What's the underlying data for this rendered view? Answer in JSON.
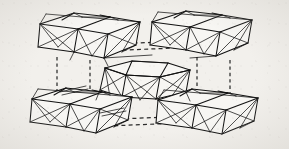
{
  "figure": {
    "kind": "line-drawing",
    "caption": "",
    "width": 289,
    "height": 149,
    "background_color": "#f2f0ec",
    "line_color": "#111111",
    "dashed_line_color": "#2b2b2b",
    "face_fill_color": "#f7f6f3"
  },
  "legend": {
    "visible": false,
    "entries": []
  },
  "labels": {
    "visible": false,
    "items": []
  },
  "chart_data": {
    "type": "diagram",
    "title": "",
    "xlabel": "",
    "ylabel": "",
    "clusters": [
      {
        "id": "cluster-top-left",
        "position": "top-left",
        "block_count": 3,
        "description": "triangulated polyhedral cluster of edge-sharing blocks"
      },
      {
        "id": "cluster-top-right",
        "position": "top-right",
        "block_count": 3,
        "description": "triangulated polyhedral cluster of edge-sharing blocks"
      },
      {
        "id": "cluster-center",
        "position": "body-center",
        "block_count": 2,
        "description": "flattened triangulated polyhedron at the body centre of the cell"
      },
      {
        "id": "cluster-bottom-left",
        "position": "bottom-left",
        "block_count": 3,
        "description": "triangulated polyhedral cluster of edge-sharing blocks"
      },
      {
        "id": "cluster-bottom-right",
        "position": "bottom-right",
        "block_count": 3,
        "description": "triangulated polyhedral cluster of edge-sharing blocks"
      }
    ],
    "unit_cell_edges": [
      {
        "id": "cell-edge-top-a",
        "style": "dashed",
        "orientation": "horizontal"
      },
      {
        "id": "cell-edge-top-b",
        "style": "dashed",
        "orientation": "horizontal"
      },
      {
        "id": "cell-edge-bottom-a",
        "style": "dashed",
        "orientation": "horizontal"
      },
      {
        "id": "cell-edge-bottom-b",
        "style": "dashed",
        "orientation": "horizontal"
      },
      {
        "id": "cell-edge-left-a",
        "style": "dashed",
        "orientation": "vertical"
      },
      {
        "id": "cell-edge-left-b",
        "style": "dashed",
        "orientation": "vertical"
      },
      {
        "id": "cell-edge-right-a",
        "style": "dashed",
        "orientation": "vertical"
      },
      {
        "id": "cell-edge-right-b",
        "style": "dashed",
        "orientation": "vertical"
      },
      {
        "id": "cell-edge-mid-left",
        "style": "solid",
        "orientation": "horizontal"
      },
      {
        "id": "cell-edge-mid-right",
        "style": "solid",
        "orientation": "horizontal"
      }
    ],
    "geometry": {
      "clusters": [
        {
          "id": "cluster-top-left",
          "fills": [
            "M 40 24 L 74 13 L 110 17 L 78 29 Z",
            "M 78 29 L 110 17 L 140 22 L 108 34 Z",
            "M 40 24 L 78 29 L 74 52 L 38 47 Z",
            "M 78 29 L 108 34 L 104 58 L 74 52 Z",
            "M 108 34 L 140 22 L 136 45 L 104 58 Z"
          ],
          "solid": [
            "M 40 24 L 74 13 L 110 17 L 140 22 L 136 45 L 104 58 L 74 52 L 38 47 Z",
            "M 40 24 L 78 29 L 110 17",
            "M 78 29 L 108 34 L 140 22",
            "M 78 29 L 74 52",
            "M 108 34 L 104 58",
            "M 62 20 L 74 13",
            "M 100 15 L 110 17"
          ],
          "thin": [
            "M 40 24 L 58 47",
            "M 40 24 L 74 52",
            "M 78 29 L 58 47",
            "M 78 29 L 38 47",
            "M 78 29 L 92 56",
            "M 108 34 L 92 56",
            "M 108 34 L 74 52",
            "M 140 22 L 122 52",
            "M 140 22 L 104 58",
            "M 108 34 L 136 45",
            "M 122 52 L 136 45",
            "M 46 14 L 40 24",
            "M 74 13 L 82 17",
            "M 82 17 L 110 17",
            "M 110 17 L 118 20",
            "M 118 20 L 140 22",
            "M 46 14 L 82 17",
            "M 82 17 L 118 20"
          ]
        },
        {
          "id": "cluster-top-right",
          "fills": [
            "M 152 22 L 186 11 L 222 15 L 190 27 Z",
            "M 190 27 L 222 15 L 252 20 L 220 32 Z",
            "M 152 22 L 190 27 L 186 50 L 150 45 Z",
            "M 190 27 L 220 32 L 216 56 L 186 50 Z",
            "M 220 32 L 252 20 L 248 43 L 216 56 Z"
          ],
          "solid": [
            "M 152 22 L 186 11 L 222 15 L 252 20 L 248 43 L 216 56 L 186 50 L 150 45 Z",
            "M 152 22 L 190 27 L 222 15",
            "M 190 27 L 220 32 L 252 20",
            "M 190 27 L 186 50",
            "M 220 32 L 216 56",
            "M 174 18 L 186 11",
            "M 212 13 L 222 15"
          ],
          "thin": [
            "M 152 22 L 170 45",
            "M 152 22 L 186 50",
            "M 190 27 L 170 45",
            "M 190 27 L 150 45",
            "M 190 27 L 204 54",
            "M 220 32 L 204 54",
            "M 220 32 L 186 50",
            "M 252 20 L 234 50",
            "M 252 20 L 216 56",
            "M 220 32 L 248 43",
            "M 234 50 L 248 43",
            "M 158 12 L 152 22",
            "M 186 11 L 194 15",
            "M 194 15 L 222 15",
            "M 222 15 L 230 18",
            "M 230 18 L 252 20",
            "M 158 12 L 194 15",
            "M 194 15 L 230 18"
          ]
        },
        {
          "id": "cluster-center",
          "fills": [
            "M 105 68 L 132 61 L 168 63 L 190 70 L 160 77 L 126 75 Z",
            "M 105 68 L 126 75 L 122 97 L 100 90 Z",
            "M 126 75 L 160 77 L 156 99 L 122 97 Z",
            "M 160 77 L 190 70 L 186 92 L 156 99 Z"
          ],
          "solid": [
            "M 105 68 L 132 61 L 168 63 L 190 70 L 186 92 L 156 99 L 122 97 L 100 90 Z",
            "M 105 68 L 126 75 L 132 61",
            "M 126 75 L 160 77 L 168 63",
            "M 160 77 L 190 70",
            "M 126 75 L 122 97",
            "M 160 77 L 156 99",
            "M 105 68 L 126 75 L 160 77 L 190 70"
          ],
          "thin": [
            "M 105 68 L 122 97",
            "M 105 68 L 110 97",
            "M 126 75 L 100 90",
            "M 126 75 L 140 100",
            "M 126 75 L 156 99",
            "M 160 77 L 122 97",
            "M 160 77 L 140 100",
            "M 160 77 L 186 92",
            "M 190 70 L 156 99",
            "M 190 70 L 172 96",
            "M 132 61 L 168 63"
          ]
        },
        {
          "id": "cluster-bottom-left",
          "fills": [
            "M 32 99 L 66 88 L 102 92 L 70 104 Z",
            "M 70 104 L 102 92 L 132 97 L 100 109 Z",
            "M 32 99 L 70 104 L 66 127 L 30 122 Z",
            "M 70 104 L 100 109 L 96 133 L 66 127 Z",
            "M 100 109 L 132 97 L 128 120 L 96 133 Z"
          ],
          "solid": [
            "M 32 99 L 66 88 L 102 92 L 132 97 L 128 120 L 96 133 L 66 127 L 30 122 Z",
            "M 32 99 L 70 104 L 102 92",
            "M 70 104 L 100 109 L 132 97",
            "M 70 104 L 66 127",
            "M 100 109 L 96 133",
            "M 54 95 L 66 88",
            "M 92 90 L 102 92"
          ],
          "thin": [
            "M 32 99 L 50 122",
            "M 32 99 L 66 127",
            "M 70 104 L 50 122",
            "M 70 104 L 30 122",
            "M 70 104 L 84 131",
            "M 100 109 L 84 131",
            "M 100 109 L 66 127",
            "M 132 97 L 114 127",
            "M 132 97 L 96 133",
            "M 100 109 L 128 120",
            "M 114 127 L 128 120",
            "M 38 89 L 32 99",
            "M 66 88 L 74 92",
            "M 74 92 L 102 92",
            "M 102 92 L 110 95",
            "M 110 95 L 132 97",
            "M 38 89 L 74 92",
            "M 74 92 L 110 95"
          ]
        },
        {
          "id": "cluster-bottom-right",
          "fills": [
            "M 158 100 L 192 89 L 228 93 L 196 105 Z",
            "M 196 105 L 228 93 L 258 98 L 226 110 Z",
            "M 158 100 L 196 105 L 192 128 L 156 123 Z",
            "M 196 105 L 226 110 L 222 134 L 192 128 Z",
            "M 226 110 L 258 98 L 254 121 L 222 134 Z"
          ],
          "solid": [
            "M 158 100 L 192 89 L 228 93 L 258 98 L 254 121 L 222 134 L 192 128 L 156 123 Z",
            "M 158 100 L 196 105 L 228 93",
            "M 196 105 L 226 110 L 258 98",
            "M 196 105 L 192 128",
            "M 226 110 L 222 134",
            "M 180 96 L 192 89",
            "M 218 91 L 228 93"
          ],
          "thin": [
            "M 158 100 L 176 123",
            "M 158 100 L 192 128",
            "M 196 105 L 176 123",
            "M 196 105 L 156 123",
            "M 196 105 L 210 132",
            "M 226 110 L 210 132",
            "M 226 110 L 192 128",
            "M 258 98 L 240 128",
            "M 258 98 L 222 134",
            "M 226 110 L 254 121",
            "M 240 128 L 254 121",
            "M 164 90 L 158 100",
            "M 192 89 L 200 93",
            "M 200 93 L 228 93",
            "M 228 93 L 236 96",
            "M 236 96 L 258 98",
            "M 164 90 L 200 93",
            "M 200 93 L 236 96"
          ]
        }
      ],
      "connectors": {
        "dashed_horizontal": [
          "M 112 44 L 186 41",
          "M 101 51 L 175 48",
          "M 118 119 L 192 116",
          "M 107 126 L 181 123"
        ],
        "dashed_vertical": [
          "M 57 57 L 57 94",
          "M 90 60 L 90 97",
          "M 197 57 L 197 94",
          "M 230 60 L 230 97"
        ],
        "solid_link": [
          "M 104 58 L 152 55",
          "M 216 56 L 190 58",
          "M 100 90 L 96 100",
          "M 186 92 L 190 101",
          "M 74 52 L 70 60",
          "M 104 58 L 108 66"
        ],
        "extra_ticks": [
          "M 60 92 L 86 86",
          "M 62 95 L 88 89",
          "M 100 113 L 124 108",
          "M 102 116 L 126 111"
        ]
      }
    }
  }
}
